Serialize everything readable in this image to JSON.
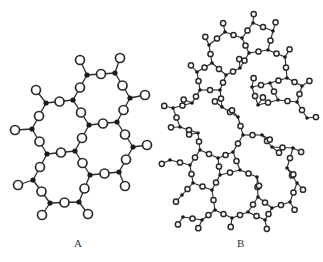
{
  "labels": {
    "a": "A",
    "b": "B"
  },
  "colors": {
    "bond": "#2a2a2a",
    "si": "#1a1a1a",
    "o_fill": "#ffffff",
    "o_stroke": "#2a2a2a"
  },
  "structure_a": {
    "description": "crystalline",
    "si": [
      [
        87,
        75
      ],
      [
        115,
        73
      ],
      [
        46,
        103
      ],
      [
        73,
        100
      ],
      [
        130,
        98
      ],
      [
        32,
        129
      ],
      [
        89,
        125
      ],
      [
        117,
        122
      ],
      [
        47,
        154
      ],
      [
        75,
        151
      ],
      [
        133,
        147
      ],
      [
        33,
        180
      ],
      [
        90,
        175
      ],
      [
        119,
        172
      ],
      [
        50,
        203
      ],
      [
        79,
        202
      ]
    ],
    "bonds": [
      [
        0,
        1
      ],
      [
        0,
        3
      ],
      [
        1,
        4
      ],
      [
        2,
        3
      ],
      [
        2,
        5
      ],
      [
        3,
        6
      ],
      [
        6,
        7
      ],
      [
        4,
        7
      ],
      [
        5,
        8
      ],
      [
        6,
        9
      ],
      [
        8,
        9
      ],
      [
        7,
        10
      ],
      [
        8,
        11
      ],
      [
        9,
        12
      ],
      [
        12,
        13
      ],
      [
        10,
        13
      ],
      [
        11,
        14
      ],
      [
        14,
        15
      ],
      [
        12,
        15
      ]
    ],
    "dangling": [
      [
        0,
        80,
        60
      ],
      [
        1,
        120,
        58
      ],
      [
        2,
        36,
        90
      ],
      [
        4,
        145,
        95
      ],
      [
        5,
        15,
        130
      ],
      [
        10,
        147,
        145
      ],
      [
        11,
        18,
        185
      ],
      [
        13,
        125,
        186
      ],
      [
        14,
        42,
        215
      ],
      [
        15,
        88,
        214
      ]
    ]
  },
  "structure_b": {
    "description": "amorphous",
    "si": [
      [
        253,
        23
      ],
      [
        273,
        31
      ],
      [
        225,
        32
      ],
      [
        242,
        38
      ],
      [
        209,
        45
      ],
      [
        268,
        50
      ],
      [
        249,
        53
      ],
      [
        285,
        57
      ],
      [
        212,
        63
      ],
      [
        240,
        68
      ],
      [
        226,
        75
      ],
      [
        197,
        72
      ],
      [
        252,
        87
      ],
      [
        270,
        83
      ],
      [
        287,
        78
      ],
      [
        302,
        86
      ],
      [
        200,
        90
      ],
      [
        220,
        90
      ],
      [
        297,
        102
      ],
      [
        278,
        100
      ],
      [
        258,
        105
      ],
      [
        192,
        103
      ],
      [
        222,
        107
      ],
      [
        173,
        108
      ],
      [
        238,
        117
      ],
      [
        307,
        118
      ],
      [
        180,
        127
      ],
      [
        198,
        133
      ],
      [
        243,
        135
      ],
      [
        262,
        135
      ],
      [
        293,
        148
      ],
      [
        272,
        147
      ],
      [
        200,
        150
      ],
      [
        233,
        152
      ],
      [
        218,
        158
      ],
      [
        170,
        160
      ],
      [
        190,
        165
      ],
      [
        240,
        170
      ],
      [
        257,
        177
      ],
      [
        287,
        168
      ],
      [
        220,
        175
      ],
      [
        193,
        183
      ],
      [
        212,
        190
      ],
      [
        297,
        183
      ],
      [
        182,
        195
      ],
      [
        258,
        197
      ],
      [
        290,
        202
      ],
      [
        272,
        208
      ],
      [
        215,
        210
      ],
      [
        183,
        217
      ],
      [
        248,
        212
      ],
      [
        232,
        218
      ],
      [
        265,
        220
      ],
      [
        202,
        220
      ]
    ],
    "max_bond": 22
  }
}
